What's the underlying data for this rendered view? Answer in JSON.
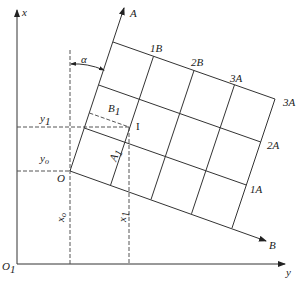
{
  "diagram": {
    "axes": {
      "x_label": "x",
      "y_label": "y",
      "origin_label": "O",
      "origin_subscript": "1"
    },
    "rotated_axes": {
      "a_label": "A",
      "b_label": "B",
      "origin_label": "O",
      "angle_label": "α"
    },
    "grid_labels": {
      "top_1": "1B",
      "top_2": "2B",
      "top_3": "3A",
      "right_top": "3A",
      "right_2": "2A",
      "right_1": "1A"
    },
    "point_label": "I",
    "cell_labels": {
      "b1": "B",
      "b1_sub": "1",
      "a1": "A",
      "a1_sub": "1"
    },
    "dimension_labels": {
      "y1": "y",
      "y1_sub": "1",
      "yo": "y",
      "yo_sub": "o",
      "xo": "x",
      "xo_sub": "o",
      "x1": "x",
      "x1_sub": "1"
    }
  }
}
